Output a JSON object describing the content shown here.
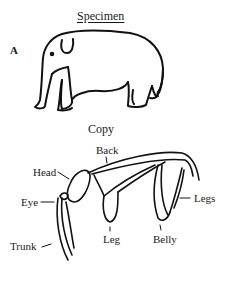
{
  "figure": {
    "panel_label": "A",
    "specimen": {
      "title": "Specimen",
      "subject": "elephant-drawing"
    },
    "copy": {
      "title": "Copy",
      "labels": {
        "back": "Back",
        "head": "Head",
        "eye": "Eye",
        "trunk": "Trunk",
        "leg": "Leg",
        "belly": "Belly",
        "legs": "Legs"
      }
    }
  }
}
